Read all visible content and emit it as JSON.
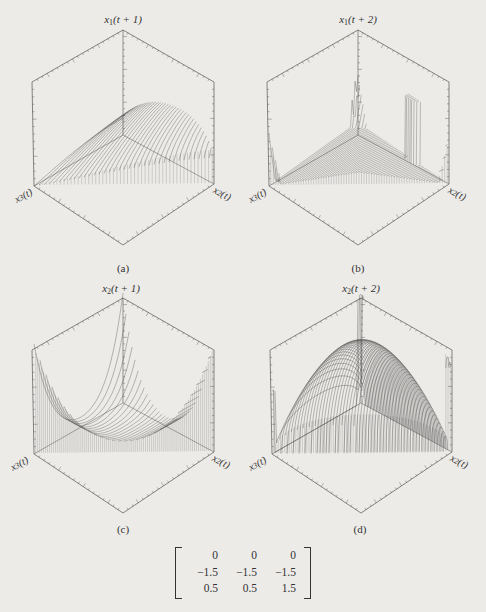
{
  "figure": {
    "background": "#ecebe8",
    "ink_color": "#3a3a3a",
    "panels": [
      {
        "id": "a",
        "caption": "(a)",
        "vertical_axis": {
          "var": "x",
          "sub": "1",
          "arg": "(t + 1)"
        },
        "left_axis": {
          "var": "x",
          "sub": "3",
          "arg": "(t)"
        },
        "right_axis": {
          "var": "x",
          "sub": "2",
          "arg": "(t)"
        },
        "surface_shape": "ridge rising toward the vertical axis, peaking near the x2(t) side and falling off sharply at the x2(t) edge"
      },
      {
        "id": "b",
        "caption": "(b)",
        "vertical_axis": {
          "var": "x",
          "sub": "1",
          "arg": "(t + 2)"
        },
        "left_axis": {
          "var": "x",
          "sub": "3",
          "arg": "(t)"
        },
        "right_axis": {
          "var": "x",
          "sub": "2",
          "arg": "(t)"
        },
        "surface_shape": "low dense triangular sheet with sharp spikes at the three corners"
      },
      {
        "id": "c",
        "caption": "(c)",
        "vertical_axis": {
          "var": "x",
          "sub": "2",
          "arg": "(t + 1)"
        },
        "left_axis": {
          "var": "x",
          "sub": "3",
          "arg": "(t)"
        },
        "right_axis": {
          "var": "x",
          "sub": "2",
          "arg": "(t)"
        },
        "surface_shape": "U-shaped valley: flat floor with steep walls rising at all three corners"
      },
      {
        "id": "d",
        "caption": "(d)",
        "vertical_axis": {
          "var": "x",
          "sub": "2",
          "arg": "(t + 2)"
        },
        "left_axis": {
          "var": "x",
          "sub": "3",
          "arg": "(t)"
        },
        "right_axis": {
          "var": "x",
          "sub": "2",
          "arg": "(t)"
        },
        "surface_shape": "dense dome-shaped hump in the center with thin spikes at the corners"
      }
    ],
    "matrix": {
      "rows": [
        [
          "0",
          "0",
          "0"
        ],
        [
          "−1.5",
          "−1.5",
          "−1.5"
        ],
        [
          "0.5",
          "0.5",
          "1.5"
        ]
      ]
    }
  },
  "chart_data": [
    {
      "type": "surface3d",
      "panel": "a",
      "title": "(a)",
      "zlabel": "x1(t + 1)",
      "xlabel": "x3(t)",
      "ylabel": "x2(t)",
      "description": "Mesh surface over simplex; high ridge along vertical axis toward x2(t) corner"
    },
    {
      "type": "surface3d",
      "panel": "b",
      "title": "(b)",
      "zlabel": "x1(t + 2)",
      "xlabel": "x3(t)",
      "ylabel": "x2(t)",
      "description": "Mostly low surface with spikes at corners"
    },
    {
      "type": "surface3d",
      "panel": "c",
      "title": "(c)",
      "zlabel": "x2(t + 1)",
      "xlabel": "x3(t)",
      "ylabel": "x2(t)",
      "description": "Valley surface rising steeply at the edges"
    },
    {
      "type": "surface3d",
      "panel": "d",
      "title": "(d)",
      "zlabel": "x2(t + 2)",
      "xlabel": "x3(t)",
      "ylabel": "x2(t)",
      "description": "Central dome with corner spikes"
    },
    {
      "type": "table",
      "title": "parameter matrix",
      "rows": [
        [
          0,
          0,
          0
        ],
        [
          -1.5,
          -1.5,
          -1.5
        ],
        [
          0.5,
          0.5,
          1.5
        ]
      ]
    }
  ]
}
